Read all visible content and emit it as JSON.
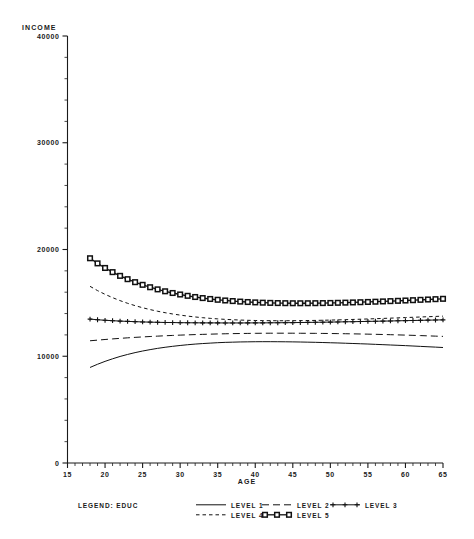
{
  "chart_data": {
    "type": "line",
    "title": "",
    "xlabel": "AGE",
    "ylabel": "INCOME",
    "xlim": [
      15,
      65
    ],
    "ylim": [
      0,
      40000
    ],
    "grid": false,
    "legend_position": "bottom",
    "legend_title": "LEGEND: EDUC",
    "x_ticks": [
      15,
      20,
      25,
      30,
      35,
      40,
      45,
      50,
      55,
      60,
      65
    ],
    "y_ticks": [
      0,
      10000,
      20000,
      30000,
      40000
    ],
    "x_tick_labels": [
      "15",
      "20",
      "25",
      "30",
      "35",
      "40",
      "45",
      "50",
      "55",
      "60",
      "65"
    ],
    "y_tick_labels": [
      "0",
      "10000",
      "20000",
      "30000",
      "40000"
    ],
    "x": [
      18,
      19,
      20,
      21,
      22,
      23,
      24,
      25,
      26,
      27,
      28,
      29,
      30,
      31,
      32,
      33,
      34,
      35,
      36,
      37,
      38,
      39,
      40,
      41,
      42,
      43,
      44,
      45,
      46,
      47,
      48,
      49,
      50,
      51,
      52,
      53,
      54,
      55,
      56,
      57,
      58,
      59,
      60,
      61,
      62,
      63,
      64,
      65
    ],
    "series": [
      {
        "name": "LEVEL 1",
        "style": "solid",
        "marker": "none",
        "values": [
          8950,
          9250,
          9520,
          9760,
          9980,
          10170,
          10340,
          10490,
          10620,
          10740,
          10840,
          10930,
          11010,
          11080,
          11140,
          11190,
          11230,
          11270,
          11300,
          11320,
          11340,
          11350,
          11360,
          11365,
          11365,
          11360,
          11355,
          11345,
          11335,
          11320,
          11305,
          11285,
          11265,
          11245,
          11220,
          11195,
          11170,
          11145,
          11115,
          11085,
          11055,
          11025,
          10995,
          10960,
          10925,
          10890,
          10855,
          10820
        ]
      },
      {
        "name": "LEVEL 2",
        "style": "dashed-long",
        "marker": "none",
        "values": [
          11450,
          11510,
          11570,
          11625,
          11675,
          11725,
          11770,
          11810,
          11850,
          11885,
          11920,
          11950,
          11980,
          12005,
          12030,
          12050,
          12070,
          12090,
          12105,
          12120,
          12130,
          12140,
          12148,
          12155,
          12158,
          12160,
          12160,
          12158,
          12155,
          12150,
          12145,
          12138,
          12130,
          12120,
          12110,
          12098,
          12085,
          12070,
          12055,
          12038,
          12020,
          12000,
          11980,
          11958,
          11935,
          11910,
          11885,
          11860
        ]
      },
      {
        "name": "LEVEL 3",
        "style": "solid",
        "marker": "plus",
        "values": [
          13480,
          13420,
          13370,
          13330,
          13295,
          13265,
          13240,
          13215,
          13195,
          13180,
          13165,
          13155,
          13145,
          13138,
          13132,
          13128,
          13125,
          13122,
          13120,
          13120,
          13120,
          13122,
          13125,
          13128,
          13132,
          13138,
          13145,
          13152,
          13160,
          13170,
          13180,
          13190,
          13200,
          13212,
          13225,
          13238,
          13250,
          13265,
          13278,
          13292,
          13305,
          13320,
          13335,
          13350,
          13365,
          13380,
          13395,
          13410
        ]
      },
      {
        "name": "LEVEL 4",
        "style": "dashed-short",
        "marker": "none",
        "values": [
          16550,
          16150,
          15800,
          15490,
          15210,
          14960,
          14740,
          14545,
          14370,
          14215,
          14080,
          13960,
          13855,
          13760,
          13680,
          13610,
          13550,
          13500,
          13455,
          13420,
          13390,
          13368,
          13350,
          13338,
          13330,
          13326,
          13326,
          13330,
          13336,
          13346,
          13358,
          13372,
          13388,
          13406,
          13426,
          13448,
          13470,
          13494,
          13518,
          13544,
          13570,
          13596,
          13624,
          13650,
          13678,
          13704,
          13730,
          13756
        ]
      },
      {
        "name": "LEVEL 5",
        "style": "solid",
        "marker": "square",
        "values": [
          19180,
          18700,
          18270,
          17880,
          17530,
          17220,
          16940,
          16690,
          16465,
          16265,
          16085,
          15925,
          15785,
          15660,
          15550,
          15450,
          15365,
          15290,
          15225,
          15170,
          15120,
          15080,
          15045,
          15018,
          14998,
          14982,
          14972,
          14966,
          14964,
          14966,
          14972,
          14980,
          14992,
          15006,
          15022,
          15042,
          15062,
          15086,
          15110,
          15136,
          15164,
          15192,
          15222,
          15252,
          15284,
          15316,
          15348,
          15380
        ]
      }
    ]
  },
  "legend": {
    "title": "LEGEND: EDUC",
    "entries": [
      {
        "label": "LEVEL 1",
        "style": "solid",
        "marker": "none"
      },
      {
        "label": "LEVEL 2",
        "style": "dashed-long",
        "marker": "none"
      },
      {
        "label": "LEVEL 3",
        "style": "solid",
        "marker": "plus"
      },
      {
        "label": "LEVEL 4",
        "style": "dashed-short",
        "marker": "none"
      },
      {
        "label": "LEVEL 5",
        "style": "solid",
        "marker": "square"
      }
    ]
  }
}
